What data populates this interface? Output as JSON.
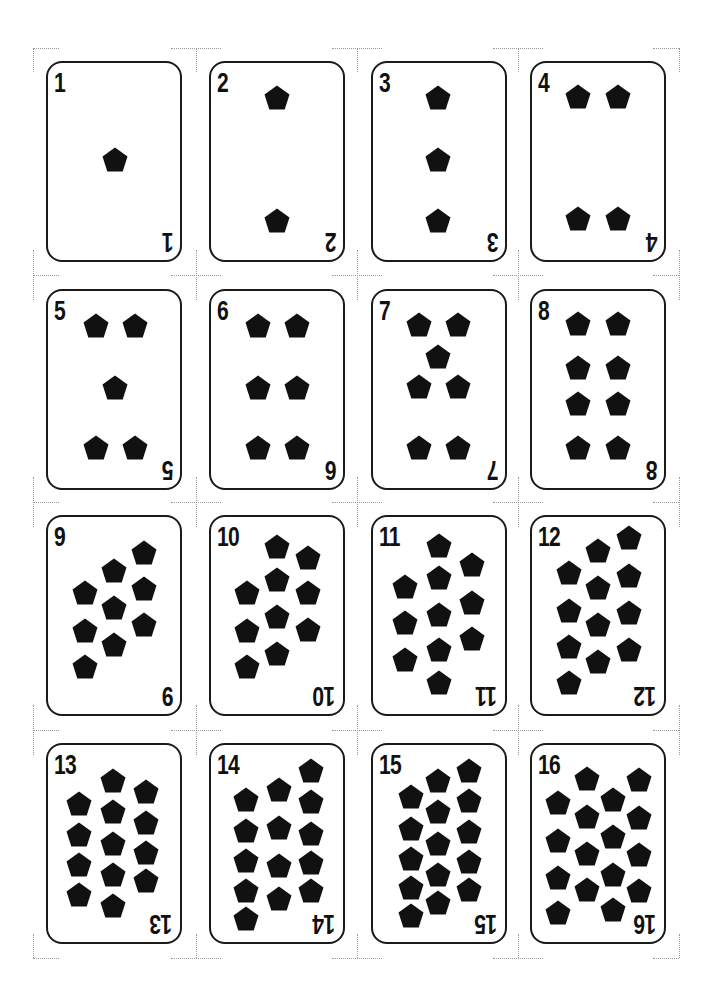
{
  "sheet": {
    "title": "Pentagon pip cards 1-16",
    "pip_shape": "pentagon-icon",
    "colors": {
      "ink": "#111111",
      "border": "#1a1a1a",
      "background": "#ffffff",
      "crop_marks": "#9a9a9a"
    },
    "grid": {
      "columns": 4,
      "rows": 4,
      "card_lefts": [
        46,
        209,
        371,
        530
      ],
      "card_tops": [
        61,
        289,
        515,
        743
      ]
    }
  },
  "cards": [
    {
      "label": "1",
      "pips": [
        [
          69,
          99
        ]
      ]
    },
    {
      "label": "2",
      "pips": [
        [
          68,
          37
        ],
        [
          68,
          160
        ]
      ]
    },
    {
      "label": "3",
      "pips": [
        [
          67,
          37
        ],
        [
          67,
          99
        ],
        [
          67,
          160
        ]
      ]
    },
    {
      "label": "4",
      "pips": [
        [
          48,
          36
        ],
        [
          88,
          36
        ],
        [
          48,
          158
        ],
        [
          88,
          158
        ]
      ]
    },
    {
      "label": "5",
      "pips": [
        [
          50,
          37
        ],
        [
          89,
          37
        ],
        [
          69,
          99
        ],
        [
          50,
          159
        ],
        [
          89,
          159
        ]
      ]
    },
    {
      "label": "6",
      "pips": [
        [
          49,
          37
        ],
        [
          88,
          37
        ],
        [
          49,
          99
        ],
        [
          88,
          99
        ],
        [
          49,
          159
        ],
        [
          88,
          159
        ]
      ]
    },
    {
      "label": "7",
      "pips": [
        [
          48,
          36
        ],
        [
          87,
          36
        ],
        [
          67,
          68
        ],
        [
          48,
          98
        ],
        [
          87,
          98
        ],
        [
          48,
          159
        ],
        [
          87,
          159
        ]
      ]
    },
    {
      "label": "8",
      "pips": [
        [
          48,
          35
        ],
        [
          88,
          35
        ],
        [
          48,
          79
        ],
        [
          88,
          79
        ],
        [
          48,
          115
        ],
        [
          88,
          115
        ],
        [
          48,
          159
        ],
        [
          88,
          159
        ]
      ]
    },
    {
      "label": "9",
      "pips": [
        [
          98,
          38
        ],
        [
          98,
          74
        ],
        [
          98,
          110
        ],
        [
          68,
          56
        ],
        [
          68,
          93
        ],
        [
          68,
          130
        ],
        [
          39,
          78
        ],
        [
          39,
          116
        ],
        [
          39,
          152
        ]
      ]
    },
    {
      "label": "10",
      "pips": [
        [
          99,
          43
        ],
        [
          99,
          78
        ],
        [
          99,
          115
        ],
        [
          68,
          32
        ],
        [
          68,
          65
        ],
        [
          68,
          102
        ],
        [
          68,
          139
        ],
        [
          38,
          78
        ],
        [
          38,
          116
        ],
        [
          38,
          152
        ]
      ]
    },
    {
      "label": "11",
      "pips": [
        [
          34,
          72
        ],
        [
          34,
          108
        ],
        [
          34,
          145
        ],
        [
          68,
          31
        ],
        [
          68,
          63
        ],
        [
          68,
          100
        ],
        [
          68,
          135
        ],
        [
          68,
          168
        ],
        [
          101,
          50
        ],
        [
          101,
          88
        ],
        [
          101,
          124
        ]
      ]
    },
    {
      "label": "12",
      "pips": [
        [
          39,
          58
        ],
        [
          39,
          96
        ],
        [
          39,
          132
        ],
        [
          39,
          168
        ],
        [
          68,
          36
        ],
        [
          68,
          73
        ],
        [
          68,
          110
        ],
        [
          68,
          147
        ],
        [
          99,
          23
        ],
        [
          99,
          61
        ],
        [
          99,
          98
        ],
        [
          99,
          135
        ]
      ]
    },
    {
      "label": "13",
      "pips": [
        [
          33,
          61
        ],
        [
          33,
          92
        ],
        [
          33,
          122
        ],
        [
          33,
          152
        ],
        [
          67,
          38
        ],
        [
          67,
          69
        ],
        [
          67,
          101
        ],
        [
          67,
          132
        ],
        [
          67,
          163
        ],
        [
          100,
          49
        ],
        [
          100,
          80
        ],
        [
          100,
          110
        ],
        [
          100,
          138
        ]
      ]
    },
    {
      "label": "14",
      "pips": [
        [
          37,
          57
        ],
        [
          37,
          88
        ],
        [
          37,
          118
        ],
        [
          37,
          148
        ],
        [
          37,
          176
        ],
        [
          70,
          47
        ],
        [
          70,
          85
        ],
        [
          70,
          123
        ],
        [
          70,
          156
        ],
        [
          102,
          28
        ],
        [
          102,
          59
        ],
        [
          102,
          91
        ],
        [
          102,
          120
        ],
        [
          102,
          148
        ]
      ]
    },
    {
      "label": "15",
      "pips": [
        [
          40,
          54
        ],
        [
          40,
          86
        ],
        [
          40,
          116
        ],
        [
          40,
          145
        ],
        [
          40,
          173
        ],
        [
          67,
          38
        ],
        [
          67,
          69
        ],
        [
          67,
          101
        ],
        [
          67,
          132
        ],
        [
          67,
          160
        ],
        [
          98,
          28
        ],
        [
          98,
          58
        ],
        [
          98,
          89
        ],
        [
          98,
          119
        ],
        [
          98,
          147
        ]
      ]
    },
    {
      "label": "16",
      "pips": [
        [
          28,
          60
        ],
        [
          28,
          98
        ],
        [
          28,
          135
        ],
        [
          28,
          170
        ],
        [
          57,
          36
        ],
        [
          57,
          74
        ],
        [
          57,
          111
        ],
        [
          57,
          147
        ],
        [
          83,
          57
        ],
        [
          83,
          94
        ],
        [
          83,
          132
        ],
        [
          83,
          167
        ],
        [
          109,
          37
        ],
        [
          109,
          75
        ],
        [
          109,
          112
        ],
        [
          109,
          148
        ]
      ]
    }
  ],
  "crop_marks": {
    "vertical_cuts_x": [
      33,
      196,
      357,
      518,
      679
    ],
    "horizontal_cuts_y": [
      48,
      275,
      502,
      730,
      958
    ]
  }
}
